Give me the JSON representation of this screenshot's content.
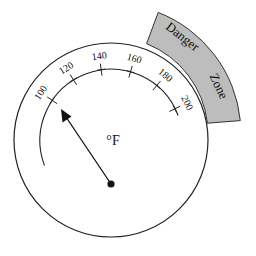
{
  "gauge": {
    "unit_label": "°F",
    "scale_ticks": [
      {
        "value": "100",
        "angle_deg": -146
      },
      {
        "value": "120",
        "angle_deg": -122
      },
      {
        "value": "140",
        "angle_deg": -98
      },
      {
        "value": "160",
        "angle_deg": -74
      },
      {
        "value": "180",
        "angle_deg": -50
      },
      {
        "value": "200",
        "angle_deg": -26
      }
    ],
    "danger_zone": {
      "label_word_1": "Danger",
      "label_word_2": "Zone",
      "fill_color": "#bdbdbd",
      "stroke_color": "#333333"
    },
    "needle": {
      "pointing_value_approx": "125"
    },
    "colors": {
      "line": "#222222",
      "background": "#ffffff"
    }
  }
}
